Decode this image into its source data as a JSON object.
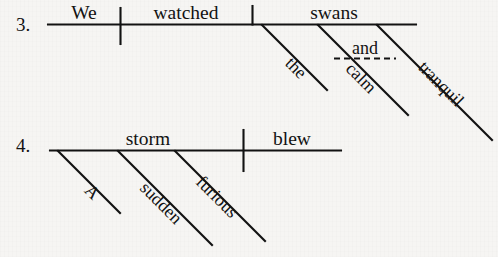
{
  "page": {
    "background_color": "#f6f5f3",
    "ink_color": "#121212"
  },
  "exercises": [
    {
      "number": "3.",
      "sentence": "We watched the calm and tranquil swans.",
      "baseline": {
        "subject": "We",
        "verb": "watched",
        "object": "swans"
      },
      "modifiers": [
        {
          "word": "the",
          "attaches_to": "swans"
        },
        {
          "word": "calm",
          "attaches_to": "swans"
        },
        {
          "word": "tranquil",
          "attaches_to": "swans"
        }
      ],
      "conjunction": {
        "word": "and",
        "joins": [
          "calm",
          "tranquil"
        ],
        "line_style": "dashed"
      }
    },
    {
      "number": "4.",
      "sentence": "A sudden furious storm blew.",
      "baseline": {
        "subject": "storm",
        "verb": "blew",
        "object": ""
      },
      "modifiers": [
        {
          "word": "A",
          "attaches_to": "storm"
        },
        {
          "word": "sudden",
          "attaches_to": "storm"
        },
        {
          "word": "furious",
          "attaches_to": "storm"
        }
      ],
      "conjunction": null
    }
  ]
}
